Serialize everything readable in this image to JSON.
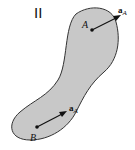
{
  "figure": {
    "label": "II",
    "body_fill": "#c8c8c8",
    "body_stroke": "#333333",
    "points": [
      {
        "name": "A",
        "vector": "a",
        "subscript": "A"
      },
      {
        "name": "B",
        "vector": "a",
        "subscript": "A"
      }
    ]
  }
}
